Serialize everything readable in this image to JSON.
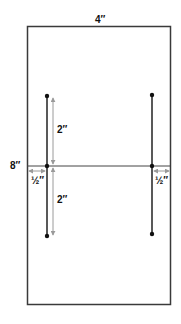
{
  "diagram": {
    "width_label": "4″",
    "height_label": "8″",
    "upper_segment_label": "2″",
    "lower_segment_label": "2″",
    "left_margin_label": "½″",
    "right_margin_label": "½″"
  },
  "colors": {
    "outline": "#3a3a3a",
    "line": "#222222",
    "dimension": "#9a9a9a"
  }
}
